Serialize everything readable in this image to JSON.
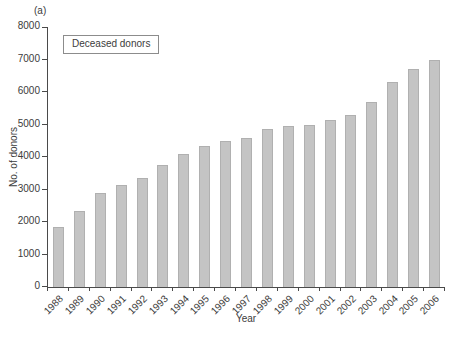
{
  "figure_label": "(a)",
  "legend": {
    "label": "Deceased donors"
  },
  "chart_data": {
    "type": "bar",
    "title": "",
    "categories": [
      "1988",
      "1989",
      "1990",
      "1991",
      "1992",
      "1993",
      "1994",
      "1995",
      "1996",
      "1997",
      "1998",
      "1999",
      "2000",
      "2001",
      "2002",
      "2003",
      "2004",
      "2005",
      "2006"
    ],
    "values": [
      1850,
      2350,
      2900,
      3150,
      3350,
      3750,
      4100,
      4350,
      4500,
      4600,
      4850,
      4950,
      5000,
      5150,
      5300,
      5700,
      6300,
      6700,
      7000
    ],
    "xlabel": "Year",
    "ylabel": "No. of donors",
    "ylim": [
      0,
      8000
    ],
    "yticks": [
      0,
      1000,
      2000,
      3000,
      4000,
      5000,
      6000,
      7000,
      8000
    ],
    "grid": false,
    "legend_position": "top-left-inside",
    "colors": {
      "bar_fill": "#c4c4c4",
      "bar_border": "#b0b0b0",
      "axis": "#4a4a4a",
      "text": "#3c3c3c",
      "legend_border": "#8c8c8c",
      "background": "#ffffff"
    }
  }
}
